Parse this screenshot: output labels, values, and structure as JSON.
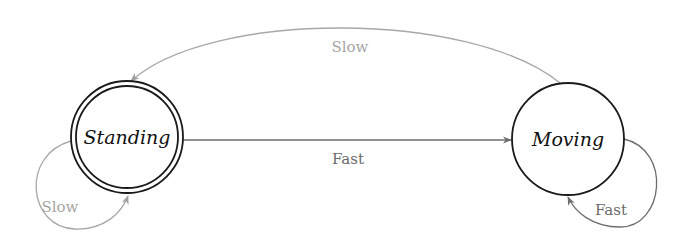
{
  "diagram": {
    "type": "state-machine",
    "colors": {
      "state_stroke": "#1a1a1a",
      "edge_fast": "#6e6e6e",
      "edge_slow": "#a8a8a8",
      "label_fast": "#6a6a6a",
      "label_slow": "#a5a5a5"
    },
    "states": [
      {
        "id": "standing",
        "label": "Standing",
        "initial": true,
        "accepting": true
      },
      {
        "id": "moving",
        "label": "Moving",
        "initial": false,
        "accepting": false
      }
    ],
    "transitions": [
      {
        "from": "standing",
        "to": "moving",
        "label": "Fast"
      },
      {
        "from": "moving",
        "to": "standing",
        "label": "Slow"
      },
      {
        "from": "standing",
        "to": "standing",
        "label": "Slow"
      },
      {
        "from": "moving",
        "to": "moving",
        "label": "Fast"
      }
    ]
  }
}
